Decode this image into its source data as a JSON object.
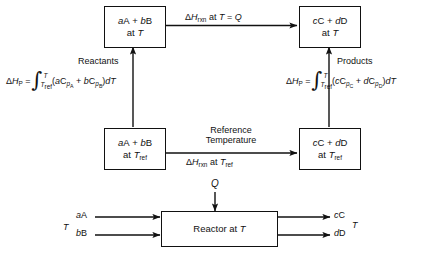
{
  "diagram": {
    "boxes": {
      "reactants_at_T": {
        "line1": "aA + bB",
        "line2": "at T"
      },
      "products_at_T": {
        "line1": "cC + dD",
        "line2": "at T"
      },
      "reactants_at_Tref": {
        "line1": "aA + bB",
        "line2": "at Tref"
      },
      "products_at_Tref": {
        "line1": "cC + dD",
        "line2": "at Tref"
      },
      "reactor": {
        "label": "Reactor at T"
      }
    },
    "arrow_labels": {
      "top_reaction": "ΔHrxn at T = Q",
      "reference_temperature_line1": "Reference",
      "reference_temperature_line2": "Temperature",
      "bottom_reaction": "ΔHrxn at Tref",
      "reactants_side": "Reactants",
      "products_side": "Products",
      "heat_input": "Q"
    },
    "integrals": {
      "left": {
        "lhs": "ΔHP =",
        "upper_limit": "T",
        "lower_limit": "Tref",
        "integrand": "(aCpA + bCpB) dT",
        "full": "ΔHP = ∫ from Tref to T of (aCpA + bCpB) dT"
      },
      "right": {
        "lhs": "ΔHP =",
        "upper_limit": "T",
        "lower_limit": "Tref",
        "integrand": "(cCpC + dCpD) dT",
        "full": "ΔHP = ∫ from Tref to T of (cCpC + dCpD) dT"
      }
    },
    "reactor_streams": {
      "inlet_temperature": "T",
      "inlet_1": "aA",
      "inlet_2": "bB",
      "outlet_1": "cC",
      "outlet_2": "dD",
      "outlet_temperature": "T"
    },
    "colors": {
      "ink": "#111111",
      "background": "#ffffff"
    }
  }
}
